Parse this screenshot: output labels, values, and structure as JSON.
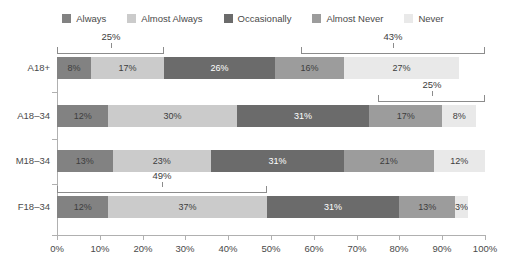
{
  "chart_data": {
    "type": "bar",
    "orientation": "horizontal",
    "stacked": true,
    "title": "",
    "xlabel": "",
    "ylabel": "",
    "xlim": [
      0,
      100
    ],
    "grid": false,
    "legend_position": "top-center",
    "categories": [
      "A18+",
      "A18–34",
      "M18–34",
      "F18–34"
    ],
    "x_ticks": [
      "0%",
      "10%",
      "20%",
      "30%",
      "40%",
      "50%",
      "60%",
      "70%",
      "80%",
      "90%",
      "100%"
    ],
    "x_tick_values": [
      0,
      10,
      20,
      30,
      40,
      50,
      60,
      70,
      80,
      90,
      100
    ],
    "series": [
      {
        "name": "Always",
        "color": "#828282",
        "values": [
          8,
          12,
          13,
          12
        ]
      },
      {
        "name": "Almost Always",
        "color": "#cbcbcb",
        "values": [
          17,
          30,
          23,
          37
        ]
      },
      {
        "name": "Occasionally",
        "color": "#6b6b6b",
        "values": [
          26,
          31,
          31,
          31
        ]
      },
      {
        "name": "Almost Never",
        "color": "#9c9c9c",
        "values": [
          16,
          17,
          21,
          13
        ]
      },
      {
        "name": "Never",
        "color": "#e9e9e9",
        "values": [
          27,
          8,
          12,
          3
        ]
      }
    ],
    "data_labels": [
      [
        "8%",
        "17%",
        "26%",
        "16%",
        "27%"
      ],
      [
        "12%",
        "30%",
        "31%",
        "17%",
        "8%"
      ],
      [
        "13%",
        "23%",
        "31%",
        "21%",
        "12%"
      ],
      [
        "12%",
        "37%",
        "31%",
        "13%",
        "3%"
      ]
    ],
    "annotations": [
      {
        "label": "25%",
        "row": 0,
        "start": 0,
        "end": 25,
        "center": 12.5
      },
      {
        "label": "43%",
        "row": 0,
        "start": 57,
        "end": 100,
        "center": 78.5
      },
      {
        "label": "25%",
        "row": 1,
        "start": 75,
        "end": 100,
        "center": 87.5
      },
      {
        "label": "49%",
        "row": 3,
        "start": 0,
        "end": 49,
        "center": 24.5
      }
    ]
  },
  "legend": {
    "items": [
      {
        "label": "Always",
        "color": "#828282"
      },
      {
        "label": "Almost Always",
        "color": "#cbcbcb"
      },
      {
        "label": "Occasionally",
        "color": "#6b6b6b"
      },
      {
        "label": "Almost Never",
        "color": "#9c9c9c"
      },
      {
        "label": "Never",
        "color": "#e9e9e9"
      }
    ]
  }
}
